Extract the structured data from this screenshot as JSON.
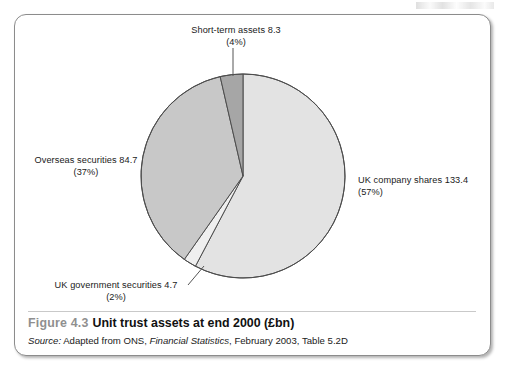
{
  "figure": {
    "number": "Figure 4.3",
    "title": "Unit trust assets at end 2000 (£bn)",
    "source_word": "Source:",
    "source_text_1": " Adapted from ONS, ",
    "source_publication": "Financial Statistics",
    "source_text_2": ", February 2003, Table 5.2D"
  },
  "labels": {
    "uk_company_shares": {
      "name": "UK company shares 133.4",
      "pct": "(57%)"
    },
    "overseas_securities": {
      "name": "Overseas securities 84.7",
      "pct": "(37%)"
    },
    "short_term_assets": {
      "name": "Short-term assets 8.3",
      "pct": "(4%)"
    },
    "uk_government_securities": {
      "name": "UK government securities 4.7",
      "pct": "(2%)"
    }
  },
  "chart_data": {
    "type": "pie",
    "title": "Unit trust assets at end 2000 (£bn)",
    "unit": "£bn",
    "total": 231.1,
    "start_angle_deg": 0,
    "direction": "clockwise",
    "legend": "none-labels-with-leader-lines",
    "grid": false,
    "categories": [
      "UK company shares",
      "UK government securities",
      "Overseas securities",
      "Short-term assets"
    ],
    "values": [
      133.4,
      4.7,
      84.7,
      8.3
    ],
    "percentages": [
      57,
      2,
      37,
      4
    ],
    "colors": [
      "#e3e3e3",
      "#efefef",
      "#c8c8c8",
      "#a6a6a6"
    ],
    "slice_order_clockwise_from_top": [
      {
        "label": "UK company shares 133.4",
        "value": 133.4,
        "pct": 57,
        "color": "#e3e3e3"
      },
      {
        "label": "UK government securities 4.7",
        "value": 4.7,
        "pct": 2,
        "color": "#efefef"
      },
      {
        "label": "Overseas securities 84.7",
        "value": 84.7,
        "pct": 37,
        "color": "#c8c8c8"
      },
      {
        "label": "Short-term assets 8.3",
        "value": 8.3,
        "pct": 4,
        "color": "#a6a6a6"
      }
    ],
    "xlabel": "",
    "ylabel": ""
  },
  "style": {
    "stroke": "#4d4d4d",
    "frame_border": "#8c8c8c",
    "figure_number_color": "#8f8f8f",
    "text_color": "#1a1a1a"
  }
}
